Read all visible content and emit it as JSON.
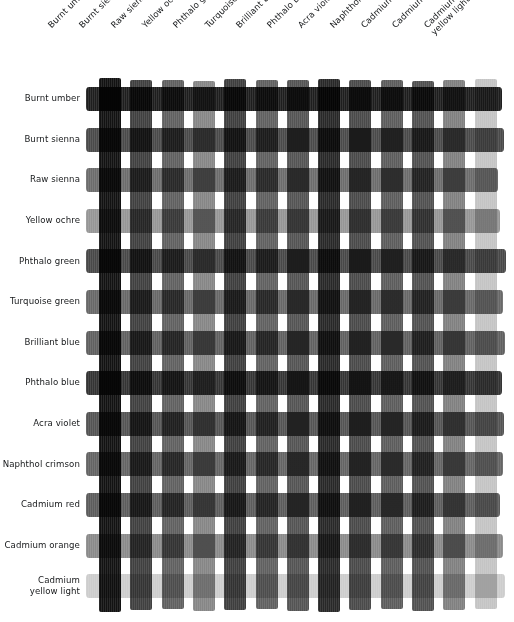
{
  "chart_data": {
    "type": "heatmap",
    "title": "",
    "xlabel": "",
    "ylabel": "",
    "grid": true,
    "legend": "none",
    "columns": [
      "Burnt umber",
      "Burnt sienna",
      "Raw sienna",
      "Yellow ochre",
      "Phthalo green",
      "Turquoise green",
      "Brilliant blue",
      "Phthalo blue",
      "Acra violet",
      "Naphthol crimson",
      "Cadmium red",
      "Cadmium orange",
      "Cadmium yellow light"
    ],
    "rows": [
      "Burnt umber",
      "Burnt sienna",
      "Raw sienna",
      "Yellow ochre",
      "Phthalo green",
      "Turquoise green",
      "Brilliant blue",
      "Phthalo blue",
      "Acra violet",
      "Naphthol crimson",
      "Cadmium red",
      "Cadmium orange",
      "Cadmium yellow light"
    ],
    "row_labels_multiline": {
      "Cadmium yellow light": "Cadmium\nyellow light"
    },
    "column_labels_multiline": {
      "Cadmium yellow light": "Cadmium\nyellow light"
    },
    "column_values": [
      18,
      64,
      96,
      134,
      62,
      96,
      84,
      40,
      74,
      92,
      80,
      128,
      196
    ],
    "row_values": [
      30,
      74,
      108,
      150,
      72,
      104,
      96,
      52,
      84,
      100,
      92,
      138,
      205
    ],
    "value_scale": "0 = black, 255 = white (perceived gray level of each single paint stripe)",
    "columns_hex": [
      "#121212",
      "#404040",
      "#606060",
      "#868686",
      "#3e3e3e",
      "#606060",
      "#545454",
      "#282828",
      "#4a4a4a",
      "#5c5c5c",
      "#505050",
      "#808080",
      "#c4c4c4"
    ],
    "rows_hex": [
      "#1e1e1e",
      "#4a4a4a",
      "#6c6c6c",
      "#969696",
      "#484848",
      "#686868",
      "#606060",
      "#343434",
      "#545454",
      "#646464",
      "#5c5c5c",
      "#8a8a8a",
      "#cdcdcd"
    ]
  },
  "geometry": {
    "col_start_x": 99,
    "col_width": 22,
    "col_pitch": 31.3,
    "row_start_y": 87,
    "row_height": 24,
    "row_pitch": 40.6,
    "row_left_x": 86,
    "row_right_x": 506
  },
  "colors": {
    "background": "#ffffff",
    "text": "#17191b"
  }
}
